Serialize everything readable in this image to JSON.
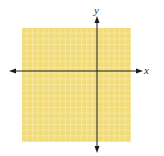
{
  "diagram": {
    "type": "coordinate-plane",
    "axes": {
      "x_label": "x",
      "y_label": "y"
    },
    "grid": {
      "fill_color": "#f2dc7a",
      "line_color": "#fbf0c4",
      "columns": 20,
      "rows": 20
    },
    "axis_color": "#1a1a1a"
  }
}
